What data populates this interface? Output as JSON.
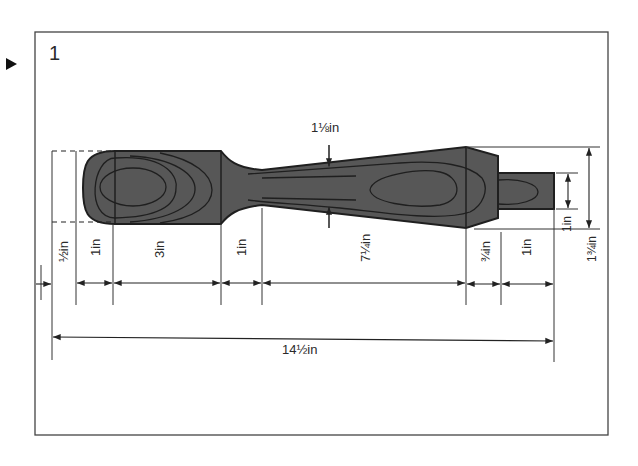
{
  "figure": {
    "step_number": "1",
    "marker": "play-triangle"
  },
  "dimensions": {
    "neck_diameter": "1⅛in",
    "knob_offset": "½in",
    "knob_radius": "1in",
    "knob_body": "3in",
    "neck_length": "1in",
    "taper_length": "7¼in",
    "collar_length": "¾in",
    "tenon_length": "1in",
    "tenon_diameter": "1in",
    "collar_diameter": "1¾in",
    "overall_length": "14½in"
  },
  "colors": {
    "wood": "#555555",
    "grain": "#222222",
    "line": "#333333",
    "frame": "#444444"
  }
}
